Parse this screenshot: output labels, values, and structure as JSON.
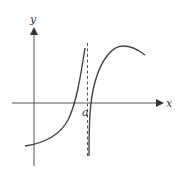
{
  "diagram": {
    "type": "function-graph",
    "axes": {
      "x_label": "x",
      "y_label": "y"
    },
    "asymptote": {
      "label": "a",
      "style": "dashed vertical line"
    },
    "colors": {
      "curve": "#444444",
      "axis": "#555555",
      "background": "#ffffff"
    }
  }
}
